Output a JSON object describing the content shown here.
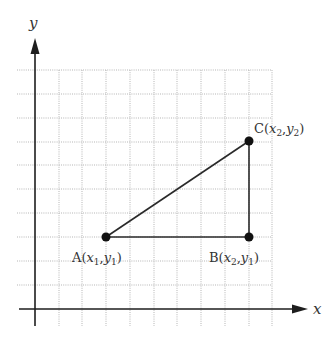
{
  "diagram": {
    "type": "coordinate-plane-right-triangle",
    "axes": {
      "x_label": "x",
      "y_label": "y"
    },
    "points": [
      {
        "id": "A",
        "name": "A",
        "x_sub": "1",
        "y_sub": "1",
        "label": "A(x1,y1)"
      },
      {
        "id": "B",
        "name": "B",
        "x_sub": "2",
        "y_sub": "1",
        "label": "B(x2,y1)"
      },
      {
        "id": "C",
        "name": "C",
        "x_sub": "2",
        "y_sub": "2",
        "label": "C(x2,y2)"
      }
    ],
    "segments": [
      "AB",
      "BC",
      "AC"
    ],
    "colors": {
      "axis": "#1e1e1e",
      "grid": "#b5b5b5",
      "segment": "#2a2a2a",
      "point": "#111111"
    }
  }
}
